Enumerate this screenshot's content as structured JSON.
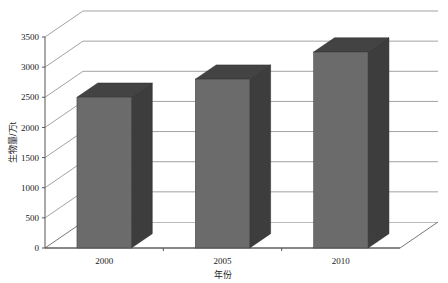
{
  "chart_data": {
    "type": "bar",
    "title": "",
    "subtitle": "",
    "xlabel": "年份",
    "ylabel": "生物量/万t",
    "categories": [
      "2000",
      "2005",
      "2010"
    ],
    "values": [
      2500,
      2800,
      3250
    ],
    "series": [
      {
        "name": "生物量",
        "values": [
          2500,
          2800,
          3250
        ]
      }
    ],
    "ylim": [
      0,
      3500
    ],
    "yticks": [
      0,
      500,
      1000,
      1500,
      2000,
      2500,
      3000,
      3500
    ],
    "ytick_labels": [
      "0",
      "500",
      "1000",
      "1500",
      "2000",
      "2500",
      "3000",
      "3500"
    ],
    "xtick_labels": [
      "2000",
      "2005",
      "2010"
    ],
    "grid": true,
    "grid_orientation": "horizontal",
    "legend": false,
    "legend_position": "none",
    "projection": "3d",
    "annotations": []
  },
  "style": {
    "bar_front_color": "#6b6b6b",
    "bar_side_color": "#3d3d3d",
    "bar_top_color": "#434343",
    "grid_color": "#8a8a8a",
    "axis_color": "#555555",
    "wall_color": "#ffffff",
    "background": "#ffffff",
    "text_color": "#1a1a1a"
  },
  "labels": {
    "y_axis_title": "生物量/万t",
    "x_axis_title": "年份"
  }
}
